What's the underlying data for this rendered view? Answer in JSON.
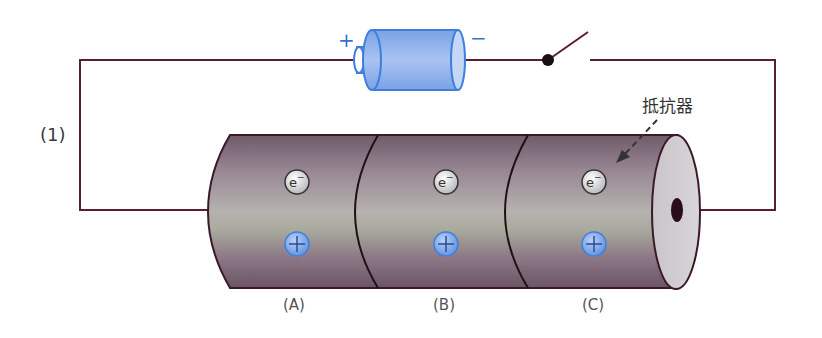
{
  "circuit_label": "(1)",
  "battery": {
    "plus": "+",
    "minus": "−"
  },
  "resistor_label": "抵抗器",
  "electron_symbol": "e−",
  "ion_symbol": "+",
  "segments": [
    {
      "label": "(A)"
    },
    {
      "label": "(B)"
    },
    {
      "label": "(C)"
    }
  ],
  "colors": {
    "wire": "#5a1e33",
    "battery_fill": "#8fb2ec",
    "battery_stroke": "#3e7fdc",
    "cylinder": "#8e7c8a",
    "ion_fill": "#7ea9ea"
  }
}
